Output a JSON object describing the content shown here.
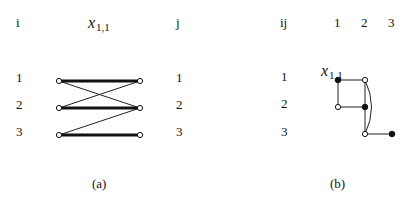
{
  "panel_a": {
    "caption": "(a)",
    "left_header": "i",
    "right_header": "j",
    "var_label": {
      "base": "x",
      "sub": "1,1"
    },
    "rows": [
      "1",
      "2",
      "3"
    ],
    "matched_edges": [
      [
        "1",
        "1"
      ],
      [
        "2",
        "2"
      ],
      [
        "3",
        "3"
      ]
    ],
    "other_edges": [
      [
        "1",
        "2"
      ],
      [
        "2",
        "1"
      ],
      [
        "3",
        "2"
      ]
    ]
  },
  "panel_b": {
    "caption": "(b)",
    "corner_header": "ij",
    "columns": [
      "1",
      "2",
      "3"
    ],
    "rows": [
      "1",
      "2",
      "3"
    ],
    "var_label": {
      "base": "x",
      "sub": "1,1"
    },
    "nodes": [
      {
        "cell": "1,1",
        "filled": true
      },
      {
        "cell": "1,2",
        "filled": false
      },
      {
        "cell": "2,1",
        "filled": false
      },
      {
        "cell": "2,2",
        "filled": true
      },
      {
        "cell": "3,2",
        "filled": false
      },
      {
        "cell": "3,3",
        "filled": true
      }
    ],
    "edges": [
      [
        "1,1",
        "1,2"
      ],
      [
        "1,1",
        "2,1"
      ],
      [
        "2,1",
        "2,2"
      ],
      [
        "1,2",
        "2,2"
      ],
      [
        "2,2",
        "3,2"
      ],
      [
        "3,2",
        "3,3"
      ],
      [
        "1,2",
        "3,2",
        "curved"
      ]
    ]
  }
}
